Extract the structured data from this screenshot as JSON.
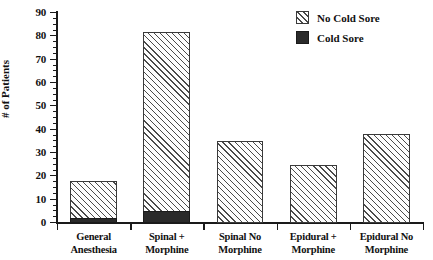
{
  "chart_data": {
    "type": "bar",
    "stacked": true,
    "title": "",
    "xlabel": "",
    "ylabel": "# of Patients",
    "ylim": [
      0,
      90
    ],
    "ytick_step": 10,
    "yminor_step": 2.5,
    "grid": false,
    "legend_position": "top-right",
    "categories": [
      "General Anesthesia",
      "Spinal + Morphine",
      "Spinal No Morphine",
      "Epidural + Morphine",
      "Epidural No Morphine"
    ],
    "category_lines": [
      [
        "General",
        "Anesthesia"
      ],
      [
        "Spinal +",
        "Morphine"
      ],
      [
        "Spinal No",
        "Morphine"
      ],
      [
        "Epidural +",
        "Morphine"
      ],
      [
        "Epidural No",
        "Morphine"
      ]
    ],
    "series": [
      {
        "name": "No Cold Sore",
        "values": [
          16,
          77,
          35,
          25,
          38
        ]
      },
      {
        "name": "Cold Sore",
        "values": [
          2,
          5,
          0,
          0,
          0
        ]
      }
    ],
    "totals": [
      18,
      82,
      35,
      25,
      38
    ],
    "ytick_labels": [
      "0",
      "10",
      "20",
      "30",
      "40",
      "50",
      "60",
      "70",
      "80",
      "90"
    ]
  },
  "legend": {
    "items": [
      {
        "label": "No Cold Sore",
        "swatch": "hatched"
      },
      {
        "label": "Cold Sore",
        "swatch": "solid-black"
      }
    ]
  },
  "colors": {
    "axis": "#1a1a1a",
    "hatch_line": "#4a4a4a",
    "cold_sore_fill": "#2a2a2a",
    "no_cold_sore_fill": "#fdfdfd",
    "background": "#ffffff"
  }
}
